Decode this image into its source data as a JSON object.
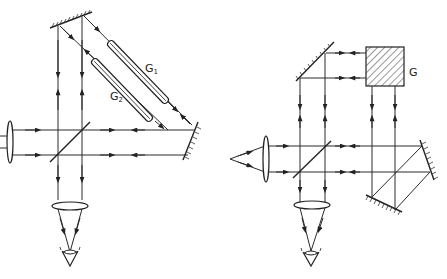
{
  "figure": {
    "left_diagram": {
      "name": "Jamin-type interferometer with two gas tubes",
      "labels": {
        "tube_1": "G",
        "tube_1_sub": "1",
        "tube_2": "G",
        "tube_2_sub": "2"
      },
      "components": [
        "source-lens",
        "beam-splitter",
        "top-mirror",
        "right-mirror",
        "gas-tube-G1",
        "gas-tube-G2",
        "eyepiece-lens",
        "eye"
      ]
    },
    "right_diagram": {
      "name": "Interferometer with gas cell G and folding mirrors",
      "labels": {
        "gas_cell": "G"
      },
      "components": [
        "point-source",
        "collimating-lens",
        "beam-splitter",
        "top-left-mirror",
        "gas-cell-G",
        "right-mirror",
        "bottom-mirror",
        "eyepiece-lens",
        "eye"
      ]
    },
    "colors": {
      "line": "#2a2a2a",
      "background": "#ffffff"
    }
  }
}
